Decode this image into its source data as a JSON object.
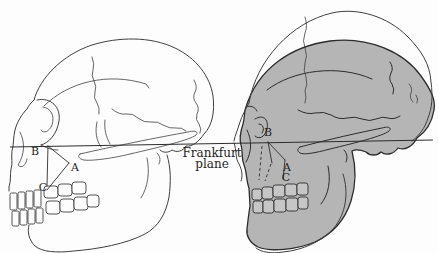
{
  "figure": {
    "frankfurt_plane": {
      "line1": "Frankfurt",
      "line2": "plane"
    },
    "left_skull": {
      "label_b": "B",
      "label_a": "A",
      "label_c": "C"
    },
    "right_skull": {
      "label_b": "B",
      "label_a": "A",
      "label_c": "C"
    },
    "colors": {
      "background": "#fdfdfd",
      "line": "#3f3f3f",
      "line_dark": "#2c2c2c",
      "skull_fill": "#b5b5b5",
      "teeth_fill": "#c6c6c6",
      "text": "#1f1f1f"
    }
  }
}
